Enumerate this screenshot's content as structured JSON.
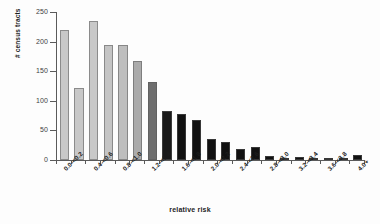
{
  "chart_data": {
    "type": "bar",
    "title": "",
    "xlabel": "relative risk",
    "ylabel": "# census tracts",
    "ylim": [
      0,
      250
    ],
    "y_ticks": [
      0,
      50,
      100,
      150,
      200,
      250
    ],
    "grid": false,
    "legend": "none",
    "categories": [
      "0.0-<0.2",
      "0.2-<0.4",
      "0.4-<0.6",
      "0.6-<0.8",
      "0.8-<1.0",
      "1.0-<1.2",
      "1.2-<1.4",
      "1.4-<1.6",
      "1.6-<1.8",
      "1.8-<2.0",
      "2.0-<2.2",
      "2.2-<2.4",
      "2.4-<2.6",
      "2.6-<2.8",
      "2.8-<3.0",
      "3.0-<3.2",
      "3.2-<3.4",
      "3.4-<3.6",
      "3.6-<3.8",
      "3.8-<4.0",
      "4.0+"
    ],
    "visible_tick_labels": [
      "0.0-<0.2",
      "0.4-<0.6",
      "0.8-<1.0",
      "1.2-<1.4",
      "1.6-<1.8",
      "2.0-<2.2",
      "2.4-<2.6",
      "2.8-<3.0",
      "3.2-<3.4",
      "3.6-<3.8",
      "4.0+"
    ],
    "values": [
      220,
      122,
      235,
      195,
      195,
      168,
      132,
      83,
      78,
      68,
      36,
      30,
      18,
      22,
      6,
      3,
      5,
      1,
      1,
      2,
      8
    ],
    "bar_colors": [
      "#c8c8c8",
      "#c8c8c8",
      "#c8c8c8",
      "#c4c4c4",
      "#bebebe",
      "#ababab",
      "#6e6e6e",
      "#1a1a1a",
      "#111111",
      "#111111",
      "#111111",
      "#111111",
      "#111111",
      "#111111",
      "#111111",
      "#111111",
      "#111111",
      "#111111",
      "#111111",
      "#111111",
      "#111111"
    ]
  },
  "axis": {
    "line_color": "#5a5a5a",
    "tick_label_color": "#3d3d3d"
  }
}
